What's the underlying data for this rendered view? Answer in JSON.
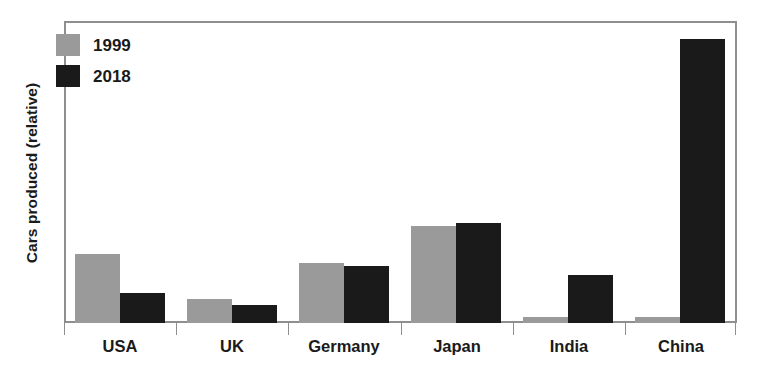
{
  "chart_data": {
    "type": "bar",
    "title": "",
    "subtitle": "",
    "xlabel": "",
    "ylabel": "Cars produced (relative)",
    "categories": [
      "USA",
      "UK",
      "Germany",
      "Japan",
      "India",
      "China"
    ],
    "series": [
      {
        "name": "1999",
        "color": "#9a9a9a",
        "values": [
          23,
          8,
          20,
          32,
          2,
          2
        ]
      },
      {
        "name": "2018",
        "color": "#1a1a1a",
        "values": [
          10,
          6,
          19,
          33,
          16,
          94
        ]
      }
    ],
    "ylim": [
      0,
      100
    ],
    "y_ticks": [],
    "grid": false,
    "legend_position": "top-left",
    "axis_color": "#8e8e8e",
    "background": "#ffffff",
    "annotations": []
  },
  "legend": {
    "items": [
      {
        "label": "1999",
        "color": "#9a9a9a"
      },
      {
        "label": "2018",
        "color": "#1a1a1a"
      }
    ]
  },
  "axes": {
    "y_title": "Cars produced (relative)",
    "x_labels": [
      "USA",
      "UK",
      "Germany",
      "Japan",
      "India",
      "China"
    ]
  }
}
